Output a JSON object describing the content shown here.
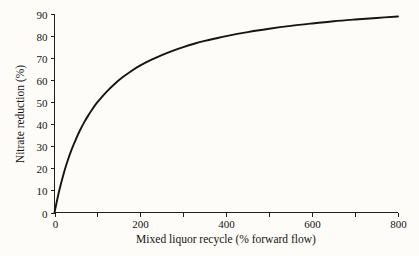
{
  "chart_data": {
    "type": "line",
    "title": "",
    "xlabel": "Mixed liquor recycle (% forward flow)",
    "ylabel": "Nitrate reduction (%)",
    "xlim": [
      0,
      800
    ],
    "ylim": [
      0,
      90
    ],
    "grid": false,
    "legend": null,
    "x_ticks": [
      0,
      100,
      200,
      300,
      400,
      500,
      600,
      700,
      800
    ],
    "x_tick_labels": [
      "0",
      "",
      "200",
      "",
      "400",
      "",
      "600",
      "",
      "800"
    ],
    "y_ticks": [
      0,
      10,
      20,
      30,
      40,
      50,
      60,
      70,
      80,
      90
    ],
    "y_tick_labels": [
      "0",
      "10",
      "20",
      "30",
      "40",
      "50",
      "60",
      "70",
      "80",
      "90"
    ],
    "series": [
      {
        "name": "Nitrate reduction",
        "color": "#141414",
        "x": [
          0,
          10,
          20,
          30,
          40,
          50,
          60,
          70,
          80,
          90,
          100,
          120,
          140,
          160,
          180,
          200,
          225,
          250,
          275,
          300,
          325,
          350,
          375,
          400,
          450,
          500,
          550,
          600,
          650,
          700,
          750,
          800
        ],
        "y": [
          0,
          9.1,
          16.7,
          23.1,
          28.6,
          33.3,
          37.5,
          41.2,
          44.4,
          47.4,
          50.0,
          54.5,
          58.3,
          61.5,
          64.3,
          66.7,
          69.2,
          71.4,
          73.3,
          75.0,
          76.5,
          77.8,
          78.9,
          80.0,
          81.8,
          83.3,
          84.6,
          85.7,
          86.7,
          87.5,
          88.2,
          88.9
        ]
      }
    ]
  },
  "axes": {
    "x_title": "Mixed liquor recycle (% forward flow)",
    "y_title": "Nitrate reduction (%)"
  }
}
